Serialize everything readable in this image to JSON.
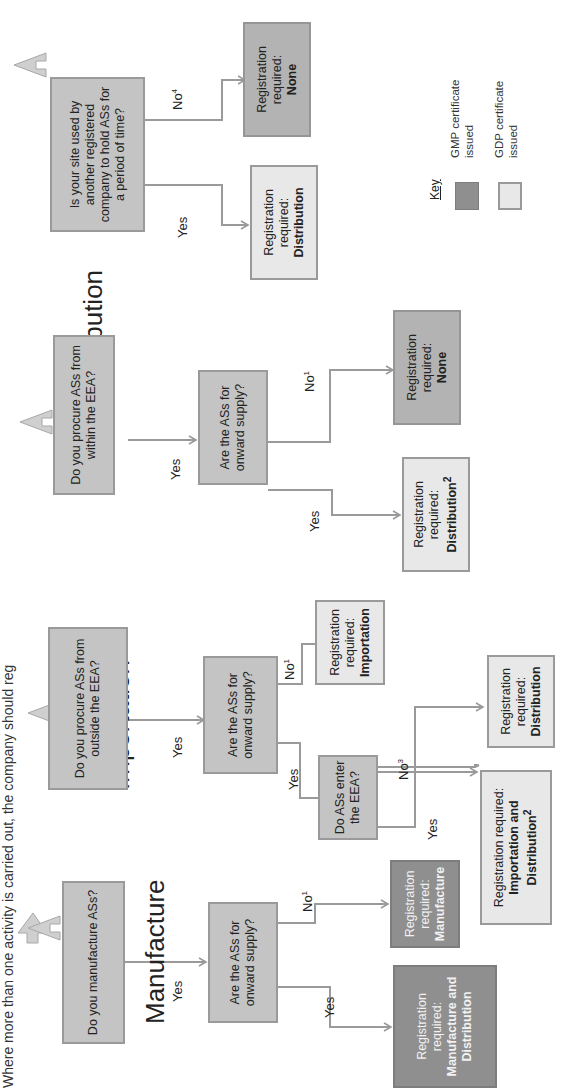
{
  "header": "Where more than one activity is carried out, the company should reg",
  "sections": {
    "manufacture": {
      "title": "Manufacture",
      "q1": "Do you manufacture ASs?",
      "q1_yes": "Yes",
      "q2": "Are the ASs for onward supply?",
      "q2_yes": "Yes",
      "q2_no": "No",
      "q2_no_sup": "1",
      "result_yes": {
        "prefix": "Registration required:",
        "value": "Manufacture and Distribution"
      },
      "result_no": {
        "prefix": "Registration required:",
        "value": "Manufacture"
      }
    },
    "importation": {
      "title": "Importation",
      "q1": "Do you procure ASs from outside the EEA?",
      "q1_yes": "Yes",
      "q2": "Are the ASs for onward supply?",
      "q2_yes": "Yes",
      "q2_no": "No",
      "q2_no_sup": "1",
      "q3": "Do ASs enter the EEA?",
      "q3_yes": "Yes",
      "q3_no": "No",
      "q3_no_sup": "3",
      "result_q2_no": {
        "prefix": "Registration required:",
        "value": "Importation"
      },
      "result_q3_yes": {
        "prefix": "Registration required:",
        "value": "Importation and Distribution",
        "sup": "2"
      },
      "result_q3_no": {
        "prefix": "Registration required:",
        "value": "Distribution"
      }
    },
    "distribution": {
      "title": "Distribution",
      "q1": "Do you procure ASs from within the EEA?",
      "q1_yes": "Yes",
      "q2": "Are the ASs for onward supply?",
      "q2_yes": "Yes",
      "q2_no": "No",
      "q2_no_sup": "1",
      "result_yes": {
        "prefix": "Registration required:",
        "value": "Distribution",
        "sup": "2"
      },
      "result_no": {
        "prefix": "Registration required:",
        "value": "None"
      }
    },
    "holding": {
      "q1": "Is your site used by another registered company to hold ASs for a period of time?",
      "q1_yes": "Yes",
      "q1_no": "No",
      "q1_no_sup": "4",
      "result_yes": {
        "prefix": "Registration required:",
        "value": "Distribution"
      },
      "result_no": {
        "prefix": "Registration required:",
        "value": "None"
      }
    }
  },
  "key": {
    "title": "Key",
    "items": [
      {
        "label": "GMP certificate issued",
        "color": "#8f8f8f"
      },
      {
        "label": "GDP certificate issued",
        "color": "#e8e8e8"
      }
    ]
  },
  "colors": {
    "question_box": "#c4c4c4",
    "gmp": "#8f8f8f",
    "gdp": "#e8e8e8",
    "none": "#b3b3b3",
    "line": "#9a9a9a"
  }
}
